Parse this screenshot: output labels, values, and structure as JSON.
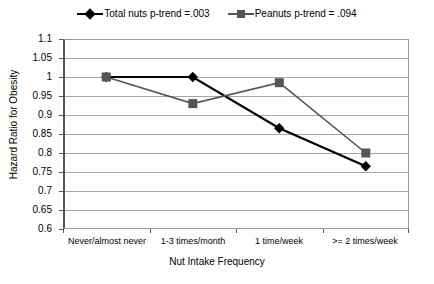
{
  "chart_data": {
    "type": "line",
    "title": "",
    "xlabel": "Nut Intake Frequency",
    "ylabel": "Hazard Ratio for Obesity",
    "categories": [
      "Never/almost never",
      "1-3 times/month",
      "1 time/week",
      ">= 2 times/week"
    ],
    "ylim": [
      0.6,
      1.1
    ],
    "ytick_labels": [
      "1.1",
      "1.05",
      "1",
      "0.95",
      "0.9",
      "0.85",
      "0.8",
      "0.75",
      "0.7",
      "0.65",
      "0.6"
    ],
    "ytick_values": [
      1.1,
      1.05,
      1.0,
      0.95,
      0.9,
      0.85,
      0.8,
      0.75,
      0.7,
      0.65,
      0.6
    ],
    "grid": true,
    "legend_position": "top",
    "series": [
      {
        "name": "Total nuts p-trend =.003",
        "marker": "diamond",
        "color": "#000000",
        "values": [
          1.0,
          1.0,
          0.865,
          0.765
        ]
      },
      {
        "name": "Peanuts p-trend = .094",
        "marker": "square",
        "color": "#555555",
        "values": [
          1.0,
          0.93,
          0.985,
          0.8
        ]
      }
    ]
  },
  "legend": {
    "entries": [
      {
        "label": "Total nuts p-trend =.003",
        "marker": "diamond-marker-icon",
        "color": "#000000"
      },
      {
        "label": "Peanuts p-trend = .094",
        "marker": "square-marker-icon",
        "color": "#555555"
      }
    ]
  },
  "axes": {
    "x_title": "Nut Intake Frequency",
    "y_title": "Hazard Ratio for Obesity",
    "y_ticks": [
      "1.1",
      "1.05",
      "1",
      "0.95",
      "0.9",
      "0.85",
      "0.8",
      "0.75",
      "0.7",
      "0.65",
      "0.6"
    ],
    "x_ticks": [
      "Never/almost never",
      "1-3 times/month",
      "1 time/week",
      ">= 2 times/week"
    ]
  }
}
